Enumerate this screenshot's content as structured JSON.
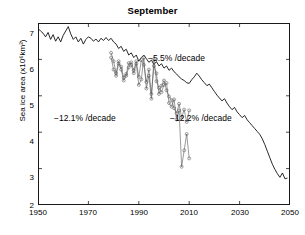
{
  "figure": {
    "title": "September",
    "ylabel": "Sea ice area (x10⁶km²)"
  },
  "annotations": {
    "model_trend": "−5.5% /decade",
    "obs_trend_left": "−12.1% /decade",
    "obs_trend_right": "−12.2% /decade"
  },
  "axis": {
    "x_ticks": [
      "1950",
      "1970",
      "1990",
      "2010",
      "2030",
      "2050"
    ],
    "y_ticks": [
      "7",
      "6",
      "5",
      "4",
      "3",
      "2"
    ]
  },
  "chart_data": {
    "type": "line",
    "title": "September",
    "xlabel": "",
    "ylabel": "Sea ice area (x10⁶km²)",
    "xlim": [
      1950,
      2050
    ],
    "ylim": [
      2,
      7
    ],
    "xticks": [
      1950,
      1970,
      1990,
      2010,
      2030,
      2050
    ],
    "yticks": [
      2,
      3,
      4,
      5,
      6,
      7
    ],
    "grid": false,
    "legend": "none",
    "annotations": [
      {
        "text": "−5.5% /decade",
        "x": 2002,
        "y": 6.35,
        "series": "model-mean"
      },
      {
        "text": "−12.1% /decade",
        "x": 1980,
        "y": 4.72,
        "series": "observations-a"
      },
      {
        "text": "−12.2% /decade",
        "x": 2004,
        "y": 4.72,
        "series": "observations-b"
      }
    ],
    "series": [
      {
        "name": "model-mean",
        "style": "solid-black-line",
        "marker": "none",
        "x": [
          1950,
          1951,
          1952,
          1953,
          1954,
          1955,
          1956,
          1957,
          1958,
          1959,
          1960,
          1961,
          1962,
          1963,
          1964,
          1965,
          1966,
          1967,
          1968,
          1969,
          1970,
          1971,
          1972,
          1973,
          1974,
          1975,
          1976,
          1977,
          1978,
          1979,
          1980,
          1981,
          1982,
          1983,
          1984,
          1985,
          1986,
          1987,
          1988,
          1989,
          1990,
          1991,
          1992,
          1993,
          1994,
          1995,
          1996,
          1997,
          1998,
          1999,
          2000,
          2001,
          2002,
          2003,
          2004,
          2005,
          2006,
          2007,
          2008,
          2009,
          2010,
          2011,
          2012,
          2013,
          2014,
          2015,
          2016,
          2017,
          2018,
          2019,
          2020,
          2021,
          2022,
          2023,
          2024,
          2025,
          2026,
          2027,
          2028,
          2029,
          2030,
          2031,
          2032,
          2033,
          2034,
          2035,
          2036,
          2037,
          2038,
          2039,
          2040,
          2041,
          2042,
          2043,
          2044,
          2045,
          2046,
          2047,
          2048,
          2049
        ],
        "y": [
          6.85,
          6.78,
          6.72,
          6.62,
          6.74,
          6.55,
          6.68,
          6.5,
          6.62,
          6.48,
          6.66,
          6.78,
          6.9,
          6.7,
          6.55,
          6.62,
          6.48,
          6.58,
          6.42,
          6.55,
          6.62,
          6.58,
          6.5,
          6.56,
          6.48,
          6.58,
          6.52,
          6.6,
          6.52,
          6.58,
          6.48,
          6.42,
          6.3,
          6.36,
          6.22,
          6.28,
          6.12,
          6.18,
          6.05,
          6.12,
          5.95,
          6.05,
          6.12,
          6.02,
          5.92,
          5.98,
          5.86,
          5.94,
          5.82,
          5.88,
          5.76,
          5.82,
          5.7,
          5.76,
          5.66,
          5.6,
          5.52,
          5.46,
          5.42,
          5.36,
          5.34,
          5.44,
          5.52,
          5.62,
          5.54,
          5.44,
          5.36,
          5.28,
          5.32,
          5.22,
          5.12,
          5.02,
          4.94,
          4.86,
          4.92,
          4.8,
          4.7,
          4.62,
          4.68,
          4.56,
          4.48,
          4.4,
          4.46,
          4.34,
          4.26,
          4.18,
          4.1,
          4.02,
          3.94,
          3.82,
          3.66,
          3.48,
          3.3,
          3.12,
          2.98,
          2.86,
          2.76,
          2.88,
          2.72,
          2.74
        ]
      },
      {
        "name": "observations-a",
        "style": "thin-gray-line",
        "marker": "circle",
        "x": [
          1979,
          1980,
          1981,
          1982,
          1983,
          1984,
          1985,
          1986,
          1987,
          1988,
          1989,
          1990,
          1991,
          1992,
          1993,
          1994,
          1995,
          1996,
          1997,
          1998,
          1999,
          2000,
          2001,
          2002,
          2003,
          2004,
          2005,
          2006,
          2007,
          2008,
          2009,
          2010
        ],
        "y": [
          6.05,
          5.72,
          5.55,
          5.88,
          5.8,
          5.5,
          5.6,
          5.9,
          5.85,
          5.62,
          5.88,
          5.3,
          5.45,
          6.05,
          5.2,
          5.55,
          4.92,
          6.0,
          5.4,
          5.22,
          5.1,
          5.3,
          5.35,
          4.8,
          4.7,
          4.9,
          4.35,
          4.6,
          3.05,
          3.5,
          3.95,
          3.28
        ]
      },
      {
        "name": "observations-b",
        "style": "thin-gray-line",
        "marker": "circle",
        "x": [
          1979,
          1980,
          1981,
          1982,
          1983,
          1984,
          1985,
          1986,
          1987,
          1988,
          1989,
          1990,
          1991,
          1992,
          1993,
          1994,
          1995,
          1996,
          1997,
          1998,
          1999,
          2000,
          2001,
          2002,
          2003,
          2004,
          2005,
          2006,
          2007,
          2008,
          2009,
          2010
        ],
        "y": [
          6.18,
          5.95,
          5.62,
          5.95,
          5.72,
          5.42,
          5.55,
          5.78,
          5.92,
          5.7,
          5.95,
          5.52,
          5.98,
          5.85,
          5.38,
          5.72,
          5.05,
          5.82,
          5.62,
          5.05,
          5.28,
          5.42,
          5.15,
          4.98,
          4.88,
          4.66,
          4.52,
          4.78,
          4.4,
          4.62,
          4.28,
          4.6
        ]
      }
    ]
  }
}
